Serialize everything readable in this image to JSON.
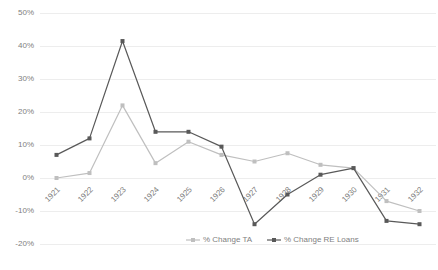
{
  "chart_data": {
    "type": "line",
    "title": "",
    "xlabel": "",
    "ylabel": "",
    "categories": [
      "1921",
      "1922",
      "1923",
      "1924",
      "1925",
      "1926",
      "1927",
      "1928",
      "1929",
      "1930",
      "1931",
      "1932"
    ],
    "ylim": [
      -20,
      50
    ],
    "yticks": [
      50,
      40,
      30,
      20,
      10,
      0,
      -10,
      -20
    ],
    "ytick_labels": [
      "50%",
      "40%",
      "30%",
      "20%",
      "10%",
      "0%",
      "-10%",
      "-20%"
    ],
    "grid": true,
    "legend_position": "bottom",
    "series": [
      {
        "name": "% Change TA",
        "color": "#bfbfbf",
        "values": [
          0,
          1.5,
          22,
          4.5,
          11,
          7,
          5,
          7.5,
          4,
          3,
          -7,
          -10
        ]
      },
      {
        "name": "% Change RE Loans",
        "color": "#595959",
        "values": [
          7,
          12,
          41.5,
          14,
          14,
          9.5,
          -14,
          -5,
          1,
          3,
          -13,
          -14
        ]
      }
    ]
  },
  "legend": {
    "items": [
      {
        "label": "% Change TA",
        "color": "#bfbfbf"
      },
      {
        "label": "% Change RE Loans",
        "color": "#595959"
      }
    ]
  }
}
